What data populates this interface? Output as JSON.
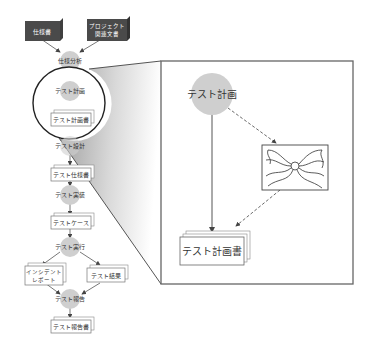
{
  "flow": {
    "inputs": [
      {
        "label": "仕様書"
      },
      {
        "label_line1": "プロジェクト",
        "label_line2": "関連文書"
      }
    ],
    "steps": [
      {
        "label": "仕様分析"
      },
      {
        "label": "テスト計画"
      },
      {
        "label": "テスト設計"
      },
      {
        "label": "テスト実装"
      },
      {
        "label": "テスト実行"
      },
      {
        "label": "テスト報告"
      }
    ],
    "documents": [
      {
        "label": "テスト計画書"
      },
      {
        "label": "テスト仕様書"
      },
      {
        "label": "テストケース"
      },
      {
        "label_line1": "インシデント",
        "label_line2": "レポート"
      },
      {
        "label": "テスト結果"
      },
      {
        "label": "テスト報告書"
      }
    ]
  },
  "zoom_panel": {
    "process": {
      "label": "テスト計画"
    },
    "output_document": {
      "label": "テスト計画書"
    },
    "tangle_image": {
      "name": "complexity-illustration"
    }
  },
  "colors": {
    "process_circle": "#cfcfcf",
    "input_box": "#4a4a4a",
    "document_fill": "#ffffff",
    "line": "#555555",
    "shadow_gradient_dark": "#9a9a9a",
    "shadow_gradient_light": "#ffffff"
  }
}
